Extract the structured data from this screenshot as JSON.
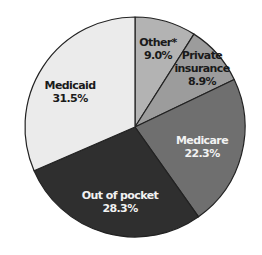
{
  "chart_data": {
    "type": "pie",
    "title": "",
    "start_angle_deg": 0,
    "direction": "clockwise",
    "slices": [
      {
        "label": "Other*",
        "value": 9.0,
        "display": "9.0%",
        "color": "#b3b3b3",
        "text_color": "#1a1a1a",
        "label_lines": [
          "Other*"
        ]
      },
      {
        "label": "Private insurance",
        "value": 8.9,
        "display": "8.9%",
        "color": "#9c9c9c",
        "text_color": "#1a1a1a",
        "label_lines": [
          "Private",
          "insurance"
        ]
      },
      {
        "label": "Medicare",
        "value": 22.3,
        "display": "22.3%",
        "color": "#6f6f6f",
        "text_color": "#f2f2f2",
        "label_lines": [
          "Medicare"
        ]
      },
      {
        "label": "Out of pocket",
        "value": 28.3,
        "display": "28.3%",
        "color": "#2f2f2f",
        "text_color": "#f2f2f2",
        "label_lines": [
          "Out of pocket"
        ]
      },
      {
        "label": "Medicaid",
        "value": 31.5,
        "display": "31.5%",
        "color": "#ebebeb",
        "text_color": "#1a1a1a",
        "label_lines": [
          "Medicaid"
        ]
      }
    ],
    "legend": "none",
    "grid": false
  },
  "labels": {
    "other": {
      "name": "Other*",
      "pct": "9.0%"
    },
    "private": {
      "line1": "Private",
      "line2": "insurance",
      "pct": "8.9%"
    },
    "medicare": {
      "name": "Medicare",
      "pct": "22.3%"
    },
    "oop": {
      "name": "Out of pocket",
      "pct": "28.3%"
    },
    "medicaid": {
      "name": "Medicaid",
      "pct": "31.5%"
    }
  }
}
